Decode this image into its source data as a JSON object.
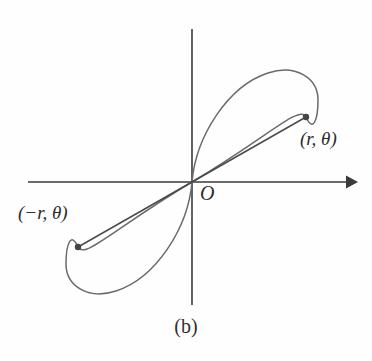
{
  "figure": {
    "caption": "(b)",
    "background_color": "#fefefe",
    "axis_color": "#3a3a3a",
    "curve_color": "#6a6a6a",
    "radial_line_color": "#4a4a4a",
    "point_marker_color": "#444444",
    "text_color": "#2b2b2b",
    "width": 372,
    "height": 361
  },
  "axes": {
    "origin": {
      "x": 192,
      "y": 182
    },
    "x_axis": {
      "name": "horizontal-axis",
      "x_start": 28,
      "x_end": 358,
      "y": 182,
      "arrow_end": "right"
    },
    "y_axis": {
      "name": "vertical-axis",
      "x": 192,
      "y_start": 29,
      "y_end": 305,
      "arrow_end": "none"
    }
  },
  "labels": {
    "origin": "O",
    "point_positive": "(r, θ)",
    "point_negative": "(−r, θ)"
  },
  "points": [
    {
      "name": "point-r-theta",
      "label": "(r, θ)",
      "x": 306,
      "y": 117,
      "radius_px": 3.2
    },
    {
      "name": "point-neg-r-theta",
      "label": "(−r, θ)",
      "x": 78,
      "y": 247,
      "radius_px": 3.2
    }
  ],
  "chart_data": {
    "type": "line",
    "title": "(b)",
    "xlabel": "",
    "ylabel": "",
    "grid": false,
    "legend": "none",
    "origin_label": "O",
    "series": [
      {
        "name": "upper-right-petal",
        "path": "M 192 182 C 196 136 228 86 268 73 C 296 64 318 78 318 100 C 318 120 313 133 306 117 C 300 104 268 137 192 182 Z"
      },
      {
        "name": "lower-left-petal",
        "path": "M 192 182 C 188 228 156 278 116 291 C 88 300 66 286 66 264 C 66 244 71 231 78 247 C 84 260 116 227 192 182 Z"
      },
      {
        "name": "radial-line-positive",
        "x": [
          192,
          306
        ],
        "y": [
          182,
          117
        ]
      },
      {
        "name": "radial-line-negative",
        "x": [
          192,
          78
        ],
        "y": [
          182,
          247
        ]
      }
    ],
    "annotations": [
      {
        "text": "(r, θ)",
        "x": 306,
        "y": 142
      },
      {
        "text": "(−r, θ)",
        "x": 22,
        "y": 215
      },
      {
        "text": "O",
        "x": 203,
        "y": 193
      },
      {
        "text": "(b)",
        "x": 186,
        "y": 330
      }
    ]
  }
}
